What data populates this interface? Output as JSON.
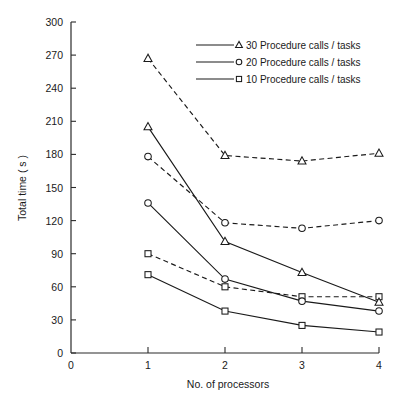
{
  "chart_data": {
    "type": "line",
    "title": "",
    "xlabel": "No. of processors",
    "ylabel": "Total time ( s )",
    "xlim": [
      0,
      4
    ],
    "ylim": [
      0,
      300
    ],
    "xticks": [
      "0",
      "1",
      "2",
      "3",
      "4"
    ],
    "yticks": [
      "0",
      "30",
      "60",
      "90",
      "120",
      "150",
      "180",
      "210",
      "240",
      "270",
      "300"
    ],
    "grid": false,
    "legend_position": "top-center",
    "x": [
      1,
      2,
      3,
      4
    ],
    "series": [
      {
        "name": "30 Procedure calls / tasks (dashed)",
        "marker": "triangle",
        "style": "dashed",
        "values": [
          267,
          179,
          174,
          181
        ]
      },
      {
        "name": "20 Procedure calls / tasks (dashed)",
        "marker": "circle",
        "style": "dashed",
        "values": [
          178,
          118,
          113,
          120
        ]
      },
      {
        "name": "10 Procedure calls / tasks (dashed)",
        "marker": "square",
        "style": "dashed",
        "values": [
          90,
          60,
          51,
          51
        ]
      },
      {
        "name": "30 Procedure calls / tasks (solid)",
        "marker": "triangle",
        "style": "solid",
        "values": [
          205,
          101,
          73,
          46
        ]
      },
      {
        "name": "20 Procedure calls / tasks (solid)",
        "marker": "circle",
        "style": "solid",
        "values": [
          136,
          67,
          47,
          38
        ]
      },
      {
        "name": "10 Procedure calls / tasks (solid)",
        "marker": "square",
        "style": "solid",
        "values": [
          71,
          38,
          25,
          19
        ]
      }
    ],
    "legend": [
      {
        "marker": "triangle",
        "label": "30 Procedure calls / tasks"
      },
      {
        "marker": "circle",
        "label": "20 Procedure calls / tasks"
      },
      {
        "marker": "square",
        "label": "10 Procedure calls / tasks"
      }
    ]
  }
}
